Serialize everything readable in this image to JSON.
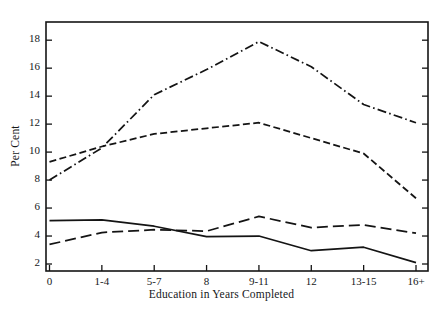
{
  "figure": {
    "background_color": "#ffffff",
    "ink_color": "#141414"
  },
  "chart_data": {
    "type": "line",
    "title": "",
    "xlabel": "Education in Years Completed",
    "ylabel": "Per Cent",
    "categories": [
      "0",
      "1-4",
      "5-7",
      "8",
      "9-11",
      "12",
      "13-15",
      "16+"
    ],
    "ylim": [
      1.5,
      19.3
    ],
    "yticks": [
      2,
      4,
      6,
      8,
      10,
      12,
      14,
      16,
      18
    ],
    "ytick_labels": [
      "2",
      "4",
      "6",
      "8",
      "10",
      "12",
      "14",
      "16",
      "18"
    ],
    "grid": false,
    "legend": "none",
    "series": [
      {
        "name": "series-dash-dot",
        "style": "dash-dot",
        "values": [
          8.0,
          10.3,
          14.1,
          15.9,
          17.9,
          16.1,
          13.4,
          12.1
        ]
      },
      {
        "name": "series-dashed",
        "style": "dashed",
        "values": [
          9.3,
          10.4,
          11.3,
          11.7,
          12.1,
          11.0,
          9.9,
          6.7
        ]
      },
      {
        "name": "series-long-dash",
        "style": "long-dash",
        "values": [
          3.4,
          4.25,
          4.45,
          4.35,
          5.4,
          4.6,
          4.8,
          4.2
        ]
      },
      {
        "name": "series-solid",
        "style": "solid",
        "values": [
          5.1,
          5.15,
          4.7,
          3.95,
          4.0,
          2.95,
          3.2,
          2.1
        ]
      }
    ]
  },
  "axes": {
    "frame_visible": true,
    "ytick_side": "both",
    "xtick_side": "bottom"
  }
}
